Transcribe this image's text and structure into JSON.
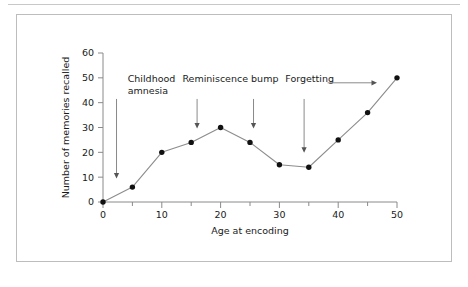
{
  "figure": {
    "border_color": "#bdbdbd",
    "rule_color": "#c8c8c8",
    "background": "#ffffff"
  },
  "chart_data": {
    "type": "line",
    "title": "",
    "subtitle": "",
    "xlabel": "Age at encoding",
    "ylabel": "Number of memories recalled",
    "xlim": [
      0,
      50
    ],
    "ylim": [
      0,
      60
    ],
    "grid": false,
    "legend": "none",
    "line_color": "#8c8c8c",
    "marker_color": "#111111",
    "x": [
      0,
      5,
      10,
      15,
      20,
      25,
      30,
      35,
      40,
      45,
      50
    ],
    "values": [
      0,
      6,
      20,
      24,
      30,
      24,
      15,
      14,
      25,
      36,
      50
    ],
    "xticks_major": [
      0,
      10,
      20,
      30,
      40,
      50
    ],
    "xticks_major_labels": [
      "0",
      "10",
      "20",
      "30",
      "40",
      "50"
    ],
    "xticks_minor": [
      5,
      15,
      25,
      35,
      45
    ],
    "yticks_major": [
      0,
      10,
      20,
      30,
      40,
      50,
      60
    ],
    "yticks_major_labels": [
      "0",
      "10",
      "20",
      "30",
      "40",
      "50",
      "60"
    ],
    "annotations": [
      {
        "id": "childhood-amnesia",
        "label_lines": [
          "Childhood",
          "amnesia"
        ],
        "label_x": 4.2,
        "label_y": 48.5,
        "arrow_kind": "vertical-down",
        "arrow_x": 2.3,
        "arrow_from_y": 41.5,
        "arrow_to_y": 9.5
      },
      {
        "id": "reminiscence-bump",
        "label_lines": [
          "Reminiscence bump"
        ],
        "label_x": 13.5,
        "label_y": 48.5,
        "arrow_kind": "vertical-down-double",
        "arrow_x": 16.0,
        "arrow_x2": 25.6,
        "arrow_from_y": 41.5,
        "arrow_to_y": 29.6
      },
      {
        "id": "forgetting",
        "label_lines": [
          "Forgetting"
        ],
        "label_x": 31.0,
        "label_y": 48.5,
        "arrow_kind": "vertical-down-plus-right",
        "arrow_x": 34.2,
        "arrow_from_y": 41.5,
        "arrow_to_y": 19.8,
        "right_arrow_from_x": 38.2,
        "right_arrow_to_x": 46.6,
        "right_arrow_y": 48.0
      }
    ]
  }
}
